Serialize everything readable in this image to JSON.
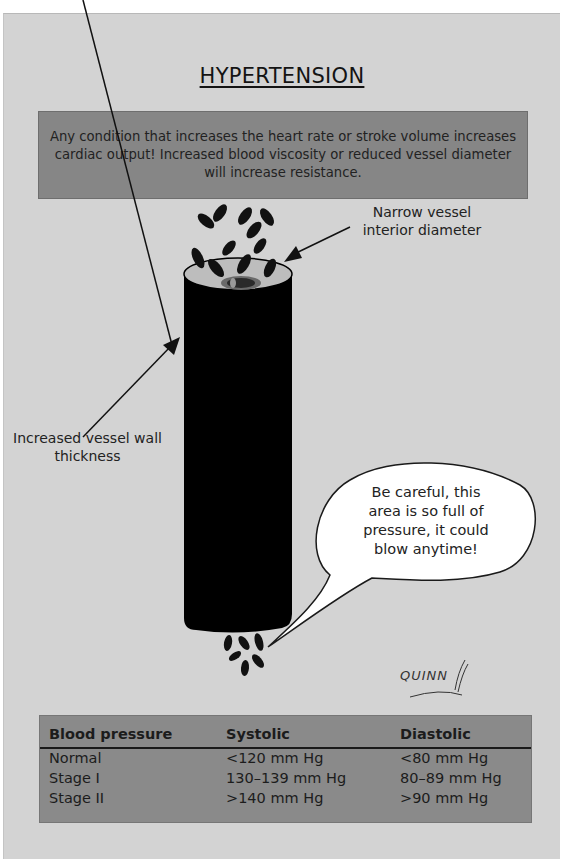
{
  "title": "HYPERTENSION",
  "info_box": {
    "text": "Any condition that increases the heart rate or stroke volume increases cardiac output! Increased blood viscosity or reduced vessel diameter will increase resistance."
  },
  "diagram": {
    "labels": {
      "narrow_vessel": "Narrow vessel interior diameter",
      "wall_thickness": "Increased vessel wall thickness"
    },
    "speech_bubble": "Be careful, this area is so full of pressure, it could blow anytime!",
    "signature": "QUINN",
    "colors": {
      "background": "#d3d3d3",
      "vessel": "#000000",
      "box": "#868686",
      "bubble": "#ffffff"
    }
  },
  "table": {
    "headers": [
      "Blood pressure",
      "Systolic",
      "Diastolic"
    ],
    "rows": [
      [
        "Normal",
        "<120 mm Hg",
        "<80 mm Hg"
      ],
      [
        "Stage I",
        "130–139 mm Hg",
        "80–89 mm Hg"
      ],
      [
        "Stage II",
        ">140 mm Hg",
        ">90 mm Hg"
      ]
    ]
  }
}
